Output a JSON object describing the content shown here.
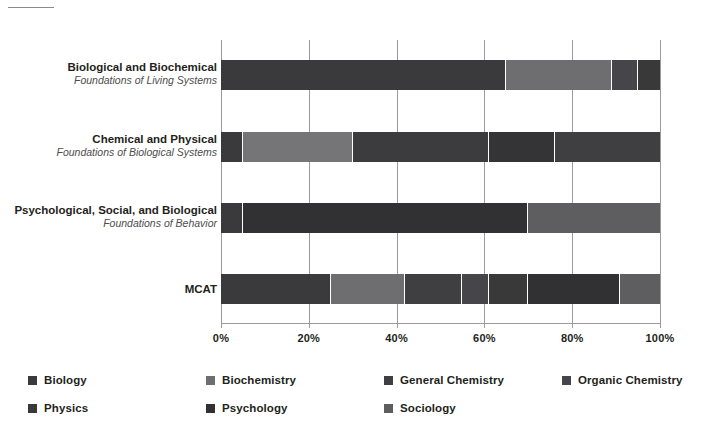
{
  "chart_data": {
    "type": "bar",
    "subtype": "horizontal-stacked-100-percent",
    "title": "",
    "xlabel": "",
    "ylabel": "",
    "xlim": [
      0,
      100
    ],
    "xticks": [
      0,
      20,
      40,
      60,
      80,
      100
    ],
    "xtick_labels": [
      "0%",
      "20%",
      "40%",
      "60%",
      "80%",
      "100%"
    ],
    "grid": "vertical",
    "legend_position": "bottom-left",
    "categories": [
      {
        "main": "Biological and Biochemical",
        "sub": "Foundations of Living Systems"
      },
      {
        "main": "Chemical and Physical",
        "sub": "Foundations of Biological Systems"
      },
      {
        "main": "Psychological, Social, and Biological",
        "sub": "Foundations of Behavior"
      },
      {
        "main": "MCAT",
        "sub": ""
      }
    ],
    "series": [
      {
        "name": "Biology",
        "color": "#3a3a3c",
        "values": [
          65,
          5,
          5,
          25
        ]
      },
      {
        "name": "Biochemistry",
        "color": "#6e6e70",
        "values": [
          24,
          0,
          0,
          17
        ]
      },
      {
        "name": "General Chemistry",
        "color": "#3f3f41",
        "values": [
          0,
          25,
          0,
          13
        ]
      },
      {
        "name": "Organic Chemistry",
        "color": "#45454a",
        "values": [
          4,
          0,
          0,
          6
        ]
      },
      {
        "name": "Physics",
        "color": "#393939",
        "values": [
          5,
          30,
          0,
          9
        ]
      },
      {
        "name": "Psychology",
        "color": "#313133",
        "values": [
          0,
          21,
          60,
          21
        ]
      },
      {
        "name": "Sociology",
        "color": "#5e5e60",
        "values": [
          0,
          15,
          30,
          9
        ]
      }
    ],
    "stacks": [
      {
        "category": "Biological and Biochemical",
        "segments": [
          {
            "name": "Biology",
            "start": 0,
            "end": 65,
            "value": 65,
            "color": "#3a3a3c"
          },
          {
            "name": "Biochemistry",
            "start": 65,
            "end": 89,
            "value": 24,
            "color": "#6e6e70"
          },
          {
            "name": "Organic Chemistry",
            "start": 89,
            "end": 95,
            "value": 6,
            "color": "#45454a"
          },
          {
            "name": "Physics",
            "start": 95,
            "end": 100,
            "value": 5,
            "color": "#393939"
          }
        ]
      },
      {
        "category": "Chemical and Physical",
        "segments": [
          {
            "name": "Biology",
            "start": 0,
            "end": 5,
            "value": 5,
            "color": "#3a3a3c"
          },
          {
            "name": "General Chemistry",
            "start": 5,
            "end": 30,
            "value": 25,
            "color": "#757577"
          },
          {
            "name": "Organic Chemistry",
            "start": 30,
            "end": 61,
            "value": 31,
            "color": "#3c3c3e"
          },
          {
            "name": "Physics",
            "start": 61,
            "end": 76,
            "value": 15,
            "color": "#343436"
          },
          {
            "name": "Biochemistry",
            "start": 76,
            "end": 100,
            "value": 24,
            "color": "#3f3f41"
          }
        ]
      },
      {
        "category": "Psychological, Social, and Biological",
        "segments": [
          {
            "name": "Biology",
            "start": 0,
            "end": 5,
            "value": 5,
            "color": "#3a3a3c"
          },
          {
            "name": "Psychology",
            "start": 5,
            "end": 70,
            "value": 65,
            "color": "#313133"
          },
          {
            "name": "Sociology",
            "start": 70,
            "end": 100,
            "value": 30,
            "color": "#5e5e60"
          }
        ]
      },
      {
        "category": "MCAT",
        "segments": [
          {
            "name": "Biology",
            "start": 0,
            "end": 25,
            "value": 25,
            "color": "#3a3a3c"
          },
          {
            "name": "Biochemistry",
            "start": 25,
            "end": 42,
            "value": 17,
            "color": "#6e6e70"
          },
          {
            "name": "General Chemistry",
            "start": 42,
            "end": 55,
            "value": 13,
            "color": "#3f3f41"
          },
          {
            "name": "Organic Chemistry",
            "start": 55,
            "end": 61,
            "value": 6,
            "color": "#45454a"
          },
          {
            "name": "Physics",
            "start": 61,
            "end": 70,
            "value": 9,
            "color": "#393939"
          },
          {
            "name": "Psychology",
            "start": 70,
            "end": 91,
            "value": 21,
            "color": "#313133"
          },
          {
            "name": "Sociology",
            "start": 91,
            "end": 100,
            "value": 9,
            "color": "#5e5e60"
          }
        ]
      }
    ],
    "legend": [
      {
        "label": "Biology",
        "color": "#3a3a3c"
      },
      {
        "label": "Biochemistry",
        "color": "#6e6e70"
      },
      {
        "label": "General Chemistry",
        "color": "#3f3f41"
      },
      {
        "label": "Organic Chemistry",
        "color": "#45454a"
      },
      {
        "label": "Physics",
        "color": "#393939"
      },
      {
        "label": "Psychology",
        "color": "#313133"
      },
      {
        "label": "Sociology",
        "color": "#5e5e60"
      }
    ]
  }
}
